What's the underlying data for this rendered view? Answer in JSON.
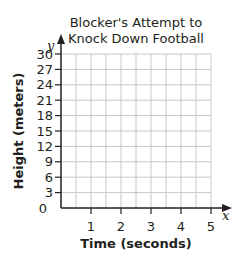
{
  "chart_data": {
    "type": "line",
    "title_lines": [
      "Blocker's Attempt to",
      "Knock Down Football"
    ],
    "xlabel": "Time (seconds)",
    "ylabel": "Height (meters)",
    "x_axis_var": "x",
    "y_axis_var": "y",
    "xlim": [
      0,
      5
    ],
    "ylim": [
      0,
      30
    ],
    "x_ticks": [
      1,
      2,
      3,
      4,
      5
    ],
    "y_ticks": [
      3,
      6,
      9,
      12,
      15,
      18,
      21,
      24,
      27,
      30
    ],
    "origin_label": "0",
    "x_grid_step": 0.5,
    "y_grid_step": 3,
    "grid": true,
    "series": []
  },
  "colors": {
    "axis": "#231f20",
    "grid": "#c8c8c8",
    "text": "#231f20"
  }
}
